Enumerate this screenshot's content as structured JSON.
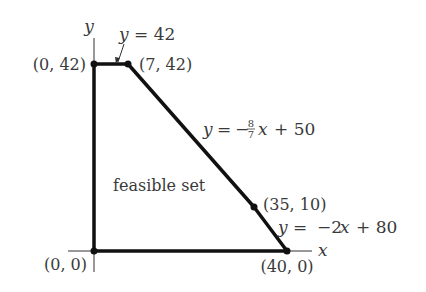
{
  "diagram": {
    "type": "feasible-region",
    "axes": {
      "x_label": "x",
      "y_label": "y"
    },
    "region_label": "feasible set",
    "vertices": [
      {
        "coords": [
          0,
          0
        ],
        "label": "(0, 0)"
      },
      {
        "coords": [
          0,
          42
        ],
        "label": "(0, 42)"
      },
      {
        "coords": [
          7,
          42
        ],
        "label": "(7, 42)"
      },
      {
        "coords": [
          35,
          10
        ],
        "label": "(35, 10)"
      },
      {
        "coords": [
          40,
          0
        ],
        "label": "(40, 0)"
      }
    ],
    "constraints": [
      {
        "equation": "y = 42",
        "lhs": "y",
        "rhs": "42"
      },
      {
        "equation": "y = -8/7 x + 50",
        "lhs": "y",
        "rhs_prefix": "−",
        "frac_num": "8",
        "frac_den": "7",
        "rhs_var": "x",
        "rhs_suffix": "+ 50"
      },
      {
        "equation": "y = -2x + 80",
        "lhs": "y",
        "rhs_prefix": "−2",
        "rhs_var": "x",
        "rhs_suffix": "+ 80"
      }
    ],
    "colors": {
      "line": "#111111",
      "text": "#3a3a3a"
    }
  }
}
